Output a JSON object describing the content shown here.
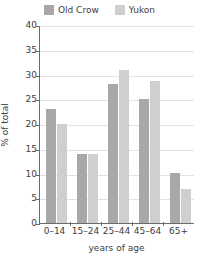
{
  "chart_data": {
    "type": "bar",
    "title": "",
    "subtitle": "",
    "xlabel": "years of age",
    "ylabel": "% of total",
    "categories": [
      "0–14",
      "15–24",
      "25–44",
      "45–64",
      "65+"
    ],
    "series": [
      {
        "name": "Old Crow",
        "color": "#a8a8a8",
        "values": [
          23,
          14,
          28,
          25,
          10.2
        ]
      },
      {
        "name": "Yukon",
        "color": "#cfcfcf",
        "values": [
          20,
          14,
          31,
          28.7,
          6.8
        ]
      }
    ],
    "ylim": [
      0,
      40
    ],
    "yticks": [
      0,
      5,
      10,
      15,
      20,
      25,
      30,
      35,
      40
    ],
    "ytick_labels": [
      "0",
      "5",
      "10",
      "15",
      "20",
      "25",
      "30",
      "35",
      "40"
    ],
    "grid": true,
    "grid_axis": "y",
    "legend_position": "top-center",
    "annotations": []
  },
  "legend": {
    "entries": [
      {
        "label": "Old Crow",
        "swatch_name": "legend-swatch-old-crow"
      },
      {
        "label": "Yukon",
        "swatch_name": "legend-swatch-yukon"
      }
    ]
  },
  "axes": {
    "y_axis_title": "% of total",
    "x_axis_title": "years of age"
  },
  "colors": {
    "series_old_crow": "#a8a8a8",
    "series_yukon": "#cfcfcf",
    "axis": "#6b6b6b",
    "gridline": "#e2e2e2",
    "text": "#3d3d3d",
    "background": "#ffffff"
  }
}
